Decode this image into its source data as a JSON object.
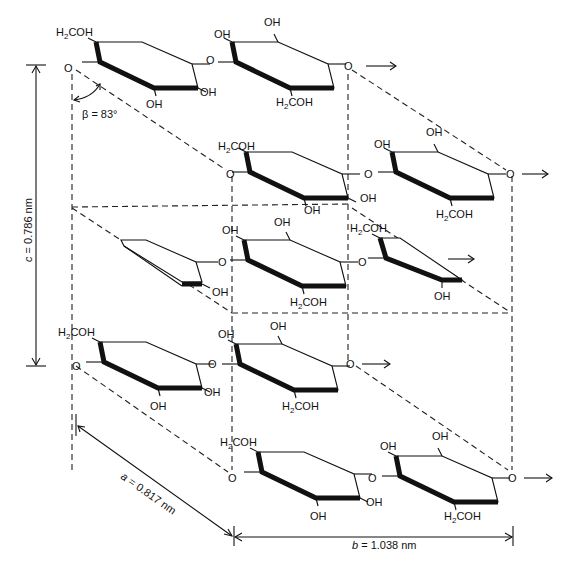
{
  "figure": {
    "colors": {
      "line": "#111111",
      "background": "#ffffff"
    }
  },
  "labels": {
    "ch2oh": "H",
    "ch2oh_sub": "2",
    "ch2oh_rest": "COH",
    "oh": "OH",
    "o": "O",
    "arrow": "→"
  },
  "dimensions": {
    "a": {
      "symbol": "a",
      "value": " = 0.817 nm"
    },
    "b": {
      "symbol": "b",
      "value": " = 1.038 nm"
    },
    "c": {
      "symbol": "c",
      "value": " = 0.786 nm"
    },
    "beta": {
      "symbol": "β",
      "value": " = 83°"
    }
  },
  "rings": [
    {
      "id": "top-left",
      "x": 70,
      "y": 42,
      "orientation": "A"
    },
    {
      "id": "top-right",
      "x": 232,
      "y": 42,
      "orientation": "B"
    },
    {
      "id": "upper-mid-left",
      "x": 228,
      "y": 146,
      "orientation": "A"
    },
    {
      "id": "upper-mid-right",
      "x": 392,
      "y": 146,
      "orientation": "B"
    },
    {
      "id": "center-left-edge",
      "x": 120,
      "y": 240,
      "orientation": "edge"
    },
    {
      "id": "center",
      "x": 232,
      "y": 236,
      "orientation": "B"
    },
    {
      "id": "center-right",
      "x": 380,
      "y": 236,
      "orientation": "A-partial"
    },
    {
      "id": "lower-left",
      "x": 88,
      "y": 346,
      "orientation": "A"
    },
    {
      "id": "lower-mid",
      "x": 232,
      "y": 346,
      "orientation": "B"
    },
    {
      "id": "bottom-left",
      "x": 248,
      "y": 454,
      "orientation": "A"
    },
    {
      "id": "bottom-right",
      "x": 396,
      "y": 454,
      "orientation": "B"
    }
  ]
}
